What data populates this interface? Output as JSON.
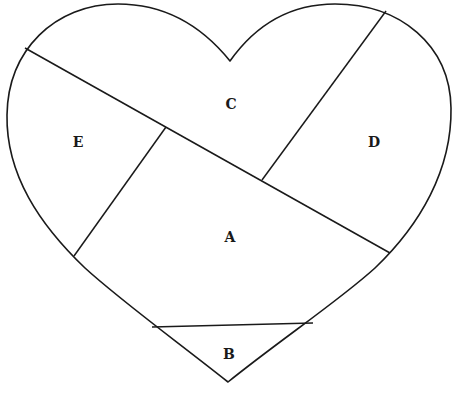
{
  "diagram": {
    "type": "heart-shaped partition",
    "colors": {
      "stroke": "#1a1a1a",
      "background": "#ffffff"
    },
    "regions": [
      {
        "id": "A",
        "label": "A",
        "x": 230,
        "y": 238
      },
      {
        "id": "B",
        "label": "B",
        "x": 229,
        "y": 355
      },
      {
        "id": "C",
        "label": "C",
        "x": 231,
        "y": 106
      },
      {
        "id": "D",
        "label": "D",
        "x": 374,
        "y": 143
      },
      {
        "id": "E",
        "label": "E",
        "x": 78,
        "y": 143
      }
    ]
  }
}
